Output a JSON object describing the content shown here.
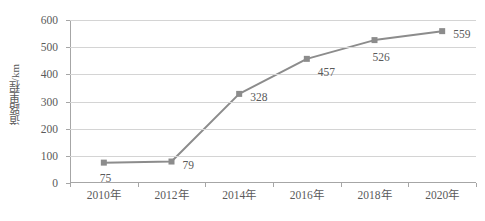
{
  "chart_data": {
    "type": "line",
    "title": "",
    "xlabel": "",
    "ylabel": "道路里程/km",
    "categories": [
      "2010年",
      "2012年",
      "2014年",
      "2016年",
      "2018年",
      "2020年"
    ],
    "values": [
      75,
      79,
      328,
      457,
      526,
      559
    ],
    "series": [
      {
        "name": "道路里程",
        "values": [
          75,
          79,
          328,
          457,
          526,
          559
        ]
      }
    ],
    "data_labels": [
      "75",
      "79",
      "328",
      "457",
      "526",
      "559"
    ],
    "ylim": [
      0,
      600
    ],
    "y_ticks": [
      0,
      100,
      200,
      300,
      400,
      500,
      600
    ],
    "y_tick_labels": [
      "0",
      "100",
      "200",
      "300",
      "400",
      "500",
      "600"
    ],
    "grid": "horizontal",
    "legend": "none",
    "colors": {
      "line": "#8c8c8c",
      "marker": "#8c8c8c",
      "gridline": "#d4d4d4",
      "axis": "#a6a6a6",
      "text": "#5a5a5a",
      "background": "#ffffff"
    },
    "marker_shape": "square"
  }
}
